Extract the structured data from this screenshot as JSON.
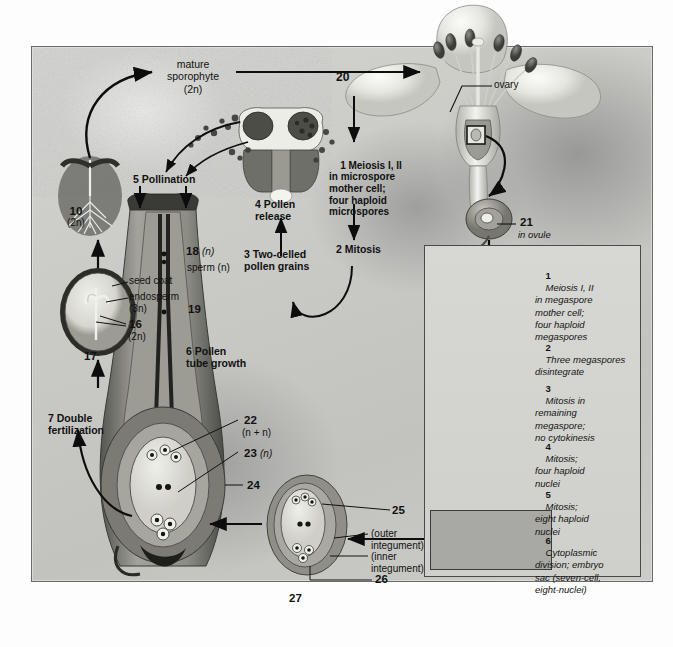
{
  "figure": {
    "frame_color": "#6a6a6a",
    "background_color": "#c9c9c6",
    "ink_color": "#111111"
  },
  "labels": {
    "mature_sporophyte": "mature\nsporophyte\n(2n)",
    "ovary": "ovary",
    "number_20": "20",
    "number_21": "21",
    "in_ovule": "in ovule",
    "step1_microspore": "1 Meiosis I, II\nin microspore\nmother cell;\nfour haploid\nmicrospores",
    "step2_mitosis": "2 Mitosis",
    "step3_pollen": "3 Two-celled\npollen grains",
    "step4_release": "4 Pollen\nrelease",
    "step5_pollination": "5 Pollination",
    "step6_tube": "6 Pollen\ntube growth",
    "step7_fertilization": "7 Double\nfertilization",
    "seedling_10": "10",
    "seedling_2n": "(2n)",
    "seed_coat": "seed coat",
    "endosperm": "endosperm",
    "endosperm_3n": "(3n)",
    "number_16": "16",
    "number_16_2n": "(2n)",
    "number_17": "17",
    "number_18": "18",
    "number_18_n": "(n)",
    "sperm_n": "sperm (n)",
    "number_19": "19",
    "number_22": "22",
    "number_22_nn": "(n + n)",
    "number_23": "23",
    "number_23_n": "(n)",
    "number_24": "24",
    "number_25": "25",
    "outer_integument": "(outer\nintegument)",
    "inner_integument": "(inner\nintegument)",
    "number_26": "26",
    "number_27": "27"
  },
  "inset": {
    "title": "Megaspore / embryo sac development",
    "steps": [
      {
        "num": "1",
        "text": "Meiosis I, II\nin megaspore\nmother cell;\nfour haploid\nmegaspores"
      },
      {
        "num": "2",
        "text": "Three megaspores\ndisintegrate"
      },
      {
        "num": "3",
        "text": "Mitosis in\nremaining\nmegaspore;\nno cytokinesis"
      },
      {
        "num": "4",
        "text": "Mitosis;\nfour haploid\nnuclei"
      },
      {
        "num": "5",
        "text": "Mitosis;\neight haploid\nnuclei"
      },
      {
        "num": "6",
        "text": "Cytoplasmic\ndivision; embryo\nsac (seven-cell,\neight-nuclei)"
      }
    ]
  }
}
